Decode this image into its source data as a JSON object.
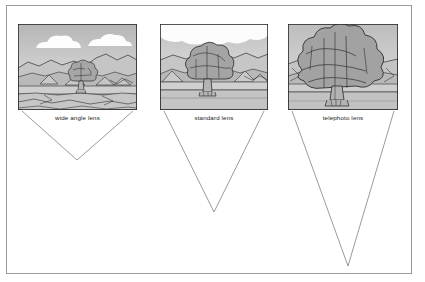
{
  "figure": {
    "background_color": "#ffffff",
    "border_color": "#9a9a9a",
    "line_color": "#3a3a3a",
    "cone_line_color": "#8a8a8a",
    "label_color": "#1a1a1a"
  },
  "palette": {
    "sky_top": "#b9b9b9",
    "sky_bottom": "#e6e6e6",
    "cloud": "#fbfbfb",
    "far_hill": "#c3c3c3",
    "mid_hill": "#b4b4b4",
    "near_hill": "#bdbdbd",
    "ground": "#c8c8c8",
    "field": "#d0d0d0",
    "foreground": "#bfbfbf",
    "foliage_light": "#b0b0b0",
    "foliage_mid": "#a0a0a0",
    "foliage_dark": "#919191",
    "trunk": "#b5b5b5",
    "outline": "#2f2f2f"
  },
  "panels": [
    {
      "id": "wide-angle",
      "label": "wide angle lens",
      "frame": {
        "x": 18,
        "y": 24,
        "width": 119,
        "height": 86
      },
      "label_position": {
        "x": 18,
        "y": 115,
        "width": 119
      },
      "tree_scale": "small",
      "tree_description": "Distant small tree centered on horizon with wide sweeping landscape, two clouds in sky",
      "cone": {
        "left_x": 22,
        "right_x": 133,
        "top_y": 111,
        "apex_x": 77,
        "apex_y": 160
      },
      "field_of_view": "wide"
    },
    {
      "id": "standard",
      "label": "standard lens",
      "frame": {
        "x": 160,
        "y": 24,
        "width": 108,
        "height": 86
      },
      "label_position": {
        "x": 160,
        "y": 115,
        "width": 108
      },
      "tree_scale": "medium",
      "tree_description": "Mid-sized tree filling central third of frame, hills either side, single cloud at top",
      "cone": {
        "left_x": 164,
        "right_x": 264,
        "top_y": 111,
        "apex_x": 214,
        "apex_y": 212
      },
      "field_of_view": "standard"
    },
    {
      "id": "telephoto",
      "label": "telephoto lens",
      "frame": {
        "x": 288,
        "y": 24,
        "width": 110,
        "height": 86
      },
      "label_position": {
        "x": 288,
        "y": 115,
        "width": 110
      },
      "tree_scale": "large",
      "tree_description": "Large tree dominating and filling nearly the whole frame, only thin strips of landscape visible",
      "cone": {
        "left_x": 292,
        "right_x": 394,
        "top_y": 111,
        "apex_x": 348,
        "apex_y": 266
      },
      "field_of_view": "narrow"
    }
  ]
}
